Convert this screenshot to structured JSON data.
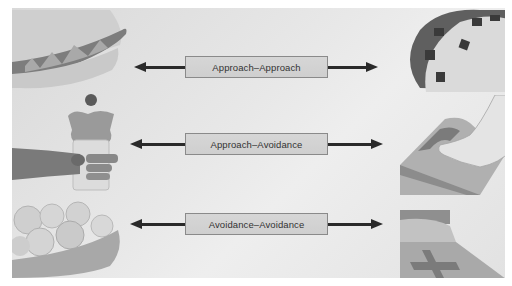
{
  "diagram": {
    "type": "conflict-types",
    "rows": [
      {
        "label": "Approach–Approach",
        "left_illustration": "hamburger",
        "right_illustration": "taco",
        "arrow": "bidirectional"
      },
      {
        "label": "Approach–Avoidance",
        "left_illustration": "hand-holding-ice-cream-sundae",
        "right_illustration": "foot-on-bathroom-scale",
        "arrow": "bidirectional"
      },
      {
        "label": "Avoidance–Avoidance",
        "left_illustration": "bowl-of-cabbage-brussels-sprouts",
        "right_illustration": "hospital-bed-with-cross",
        "arrow": "bidirectional"
      }
    ]
  },
  "colors": {
    "background": "#e6e6e6",
    "label_box": "#d3d3d3",
    "label_border": "#8a8a8a",
    "arrow": "#2a2a2a",
    "text": "#333333"
  }
}
